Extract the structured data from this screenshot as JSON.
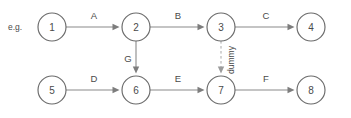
{
  "diagram": {
    "caption": "e.g.",
    "nodes": [
      {
        "id": "n1",
        "label": "1",
        "cx": 52,
        "cy": 27,
        "r": 14
      },
      {
        "id": "n2",
        "label": "2",
        "cx": 136,
        "cy": 27,
        "r": 14
      },
      {
        "id": "n3",
        "label": "3",
        "cx": 221,
        "cy": 27,
        "r": 14
      },
      {
        "id": "n4",
        "label": "4",
        "cx": 311,
        "cy": 27,
        "r": 14
      },
      {
        "id": "n5",
        "label": "5",
        "cx": 52,
        "cy": 90,
        "r": 14
      },
      {
        "id": "n6",
        "label": "6",
        "cx": 136,
        "cy": 90,
        "r": 14
      },
      {
        "id": "n7",
        "label": "7",
        "cx": 221,
        "cy": 90,
        "r": 14
      },
      {
        "id": "n8",
        "label": "8",
        "cx": 311,
        "cy": 90,
        "r": 14
      }
    ],
    "edges": [
      {
        "id": "eA",
        "label": "A",
        "from": "n1",
        "to": "n2",
        "style": "solid",
        "orientation": "horizontal",
        "label_x": 94,
        "label_y": 15
      },
      {
        "id": "eB",
        "label": "B",
        "from": "n2",
        "to": "n3",
        "style": "solid",
        "orientation": "horizontal",
        "label_x": 178,
        "label_y": 15
      },
      {
        "id": "eC",
        "label": "C",
        "from": "n3",
        "to": "n4",
        "style": "solid",
        "orientation": "horizontal",
        "label_x": 266,
        "label_y": 15
      },
      {
        "id": "eD",
        "label": "D",
        "from": "n5",
        "to": "n6",
        "style": "solid",
        "orientation": "horizontal",
        "label_x": 94,
        "label_y": 78
      },
      {
        "id": "eE",
        "label": "E",
        "from": "n6",
        "to": "n7",
        "style": "solid",
        "orientation": "horizontal",
        "label_x": 178,
        "label_y": 78
      },
      {
        "id": "eF",
        "label": "F",
        "from": "n7",
        "to": "n8",
        "style": "solid",
        "orientation": "horizontal",
        "label_x": 266,
        "label_y": 78
      },
      {
        "id": "eG",
        "label": "G",
        "from": "n2",
        "to": "n6",
        "style": "solid",
        "orientation": "vertical",
        "label_x": 128,
        "label_y": 58
      },
      {
        "id": "eDummy",
        "label": "dummy",
        "from": "n3",
        "to": "n7",
        "style": "dashed",
        "orientation": "vertical",
        "label_x": 231,
        "label_y": 60
      }
    ],
    "colors": {
      "node_stroke": "#6a6a6a",
      "edge_stroke": "#8a8a8a",
      "dummy_stroke": "#a9a9a9",
      "text": "#4a4a4a",
      "background": "#ffffff"
    }
  }
}
